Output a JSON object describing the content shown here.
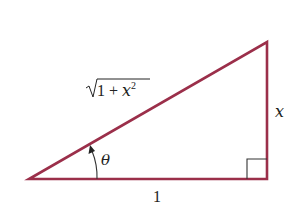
{
  "diagram": {
    "type": "right-triangle",
    "colors": {
      "triangle_stroke": "#9b2f4a",
      "annotation_stroke": "#333333",
      "text": "#222222",
      "background": "#ffffff"
    },
    "labels": {
      "hypotenuse": {
        "radical": "√",
        "body": "1 + ",
        "var": "x",
        "exponent": "2"
      },
      "opposite": "x",
      "adjacent": "1",
      "angle": "θ"
    }
  }
}
